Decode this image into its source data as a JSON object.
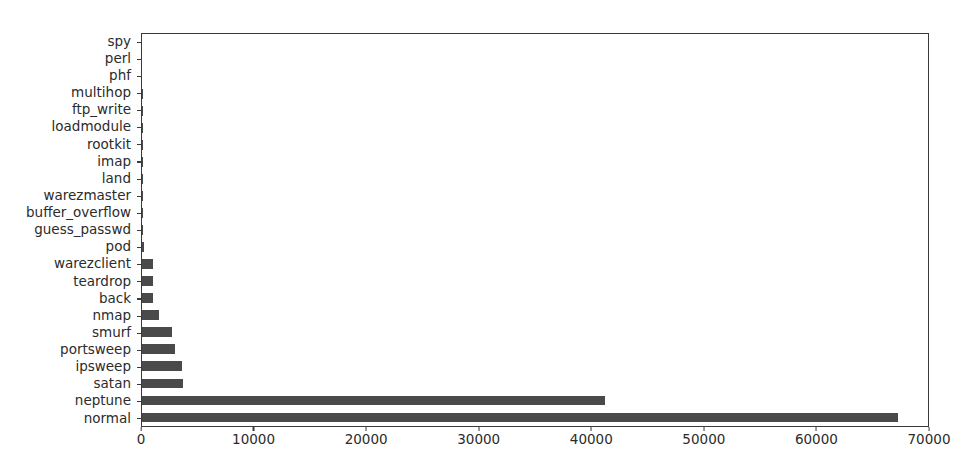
{
  "chart_data": {
    "type": "bar",
    "orientation": "horizontal",
    "title": "",
    "xlabel": "",
    "ylabel": "",
    "xlim": [
      0,
      70000
    ],
    "ylim": [
      0,
      23
    ],
    "grid": false,
    "legend": null,
    "bar_color": "#4a4a4a",
    "axis_color": "#3a3a3a",
    "background": "#ffffff",
    "xticks": [
      0,
      10000,
      20000,
      30000,
      40000,
      50000,
      60000,
      70000
    ],
    "xticklabels": [
      "0",
      "10000",
      "20000",
      "30000",
      "40000",
      "50000",
      "60000",
      "70000"
    ],
    "categories": [
      "spy",
      "perl",
      "phf",
      "multihop",
      "ftp_write",
      "loadmodule",
      "rootkit",
      "imap",
      "land",
      "warezmaster",
      "buffer_overflow",
      "guess_passwd",
      "pod",
      "warezclient",
      "teardrop",
      "back",
      "nmap",
      "smurf",
      "portsweep",
      "ipsweep",
      "satan",
      "neptune",
      "normal"
    ],
    "values": [
      2,
      3,
      4,
      7,
      8,
      9,
      10,
      12,
      21,
      20,
      30,
      53,
      201,
      1020,
      979,
      956,
      1493,
      2646,
      2931,
      3599,
      3633,
      41214,
      67343
    ]
  },
  "axis": {
    "frame_visible": true
  },
  "caption_sliver": ""
}
